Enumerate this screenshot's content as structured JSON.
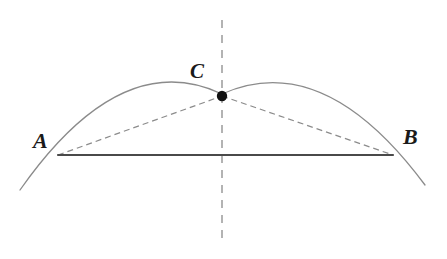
{
  "figure": {
    "type": "geometry-diagram",
    "background_color": "#ffffff",
    "width": 447,
    "height": 259
  },
  "labels": {
    "a": "A",
    "b": "B",
    "c": "C"
  },
  "points": {
    "A": {
      "name": "A",
      "x": 58,
      "y": 155
    },
    "B": {
      "name": "B",
      "x": 393,
      "y": 155
    },
    "C": {
      "name": "C",
      "x": 222,
      "y": 96
    }
  },
  "curves": {
    "arc": {
      "name": "arc",
      "start_x": 20,
      "start_y": 190,
      "apex_x": 222,
      "apex_y": 94,
      "end_x": 425,
      "end_y": 185,
      "stroke_color": "#8b8b8b",
      "stroke_width": 1.3,
      "dashed": false
    },
    "chord_ab": {
      "name": "chord-AB",
      "from": "A",
      "to": "B",
      "stroke_color": "#4a4a4a",
      "stroke_width": 2.2,
      "dashed": false
    },
    "chord_ac": {
      "name": "chord-AC",
      "from": "A",
      "to": "C",
      "stroke_color": "#8b8b8b",
      "stroke_width": 1.2,
      "dashed": true,
      "dash_pattern": "6,4"
    },
    "chord_cb": {
      "name": "chord-CB",
      "from": "C",
      "to": "B",
      "stroke_color": "#8b8b8b",
      "stroke_width": 1.2,
      "dashed": true,
      "dash_pattern": "6,4"
    },
    "axis_of_symmetry": {
      "name": "axis-of-symmetry",
      "x": 222,
      "top_y": 20,
      "bottom_y": 245,
      "stroke_color": "#8b8b8b",
      "stroke_width": 1.3,
      "dashed": true,
      "dash_pattern": "8,7"
    }
  },
  "markers": {
    "point_c_dot": {
      "name": "point-C-marker",
      "cx": 222,
      "cy": 96,
      "r": 5.2,
      "fill": "#111111"
    }
  }
}
